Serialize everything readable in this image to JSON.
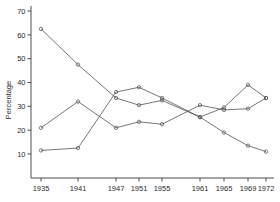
{
  "chart_data": {
    "type": "line",
    "title": "",
    "xlabel": "",
    "ylabel": "Percentage",
    "x": [
      1935,
      1941,
      1947,
      1951,
      1955,
      1961,
      1965,
      1969,
      1972
    ],
    "categories": [
      "1935",
      "1941",
      "1947",
      "1951",
      "1955",
      "1961",
      "1965",
      "1969",
      "1972"
    ],
    "xtick_labels": [
      "1935",
      "1941",
      "1947",
      "1951",
      "1955",
      "1961",
      "1965",
      "1969",
      "1972"
    ],
    "ytick_labels": [
      "10",
      "20",
      "30",
      "40",
      "50",
      "60",
      "70"
    ],
    "yticks": [
      10,
      20,
      30,
      40,
      50,
      60,
      70
    ],
    "ylim": [
      4,
      72
    ],
    "xlim": [
      1933,
      1974
    ],
    "grid": false,
    "legend": "none",
    "markers": "open-circle",
    "series": [
      {
        "name": "series-1",
        "values": [
          62.5,
          47.5,
          33.5,
          30.5,
          32.5,
          25.5,
          19.0,
          13.5,
          11.0
        ]
      },
      {
        "name": "series-2",
        "values": [
          21.0,
          32.0,
          21.0,
          23.5,
          22.5,
          30.5,
          28.5,
          29.0,
          33.5
        ]
      },
      {
        "name": "series-3",
        "values": [
          11.5,
          12.5,
          36.0,
          38.0,
          33.5,
          25.5,
          29.5,
          39.0,
          33.5
        ]
      }
    ]
  }
}
